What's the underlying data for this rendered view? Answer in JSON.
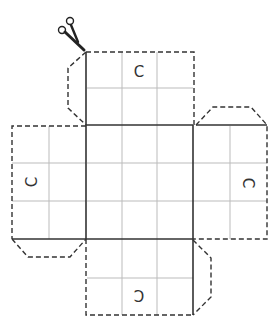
{
  "diagram": {
    "title": "",
    "colors": {
      "line": "#333333",
      "grid": "#bbbbbb",
      "background": "#ffffff"
    },
    "labels": {
      "top": "C",
      "left": "C",
      "right": "C",
      "bottom": "C"
    },
    "icons": {
      "cut": "scissors-icon"
    }
  }
}
